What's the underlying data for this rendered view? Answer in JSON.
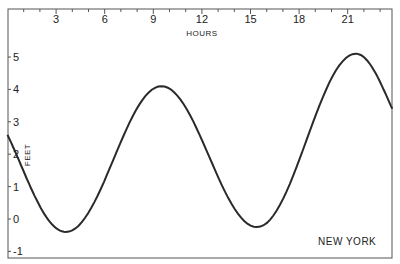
{
  "chart_data": {
    "type": "line",
    "title": "",
    "xlabel": "HOURS",
    "ylabel": "FEET",
    "x_ticks": [
      3,
      6,
      9,
      12,
      15,
      18,
      21
    ],
    "y_ticks": [
      -1,
      0,
      1,
      2,
      3,
      4,
      5
    ],
    "xlim": [
      0,
      23.75
    ],
    "ylim": [
      -1.2,
      6.5
    ],
    "grid": false,
    "legend": null,
    "annotations": [
      "NEW YORK"
    ],
    "series": [
      {
        "name": "New York tide height",
        "x": [
          0,
          1,
          2,
          3,
          3.6,
          4.5,
          6,
          7.5,
          9,
          9.5,
          10.5,
          12,
          13.5,
          15,
          15.4,
          16.5,
          18,
          19.5,
          21,
          21.5,
          22.5,
          23.75
        ],
        "values": [
          2.6,
          1.6,
          0.5,
          -0.3,
          -0.4,
          -0.2,
          1.1,
          2.8,
          4.0,
          4.1,
          3.7,
          2.2,
          0.4,
          -0.2,
          -0.25,
          0.2,
          1.8,
          3.8,
          5.0,
          5.1,
          4.8,
          3.4
        ]
      }
    ],
    "extrema": [
      {
        "kind": "start",
        "hour": 0,
        "feet": 2.6
      },
      {
        "kind": "low",
        "hour": 3.6,
        "feet": -0.4
      },
      {
        "kind": "high",
        "hour": 9.5,
        "feet": 4.1
      },
      {
        "kind": "low",
        "hour": 15.4,
        "feet": -0.25
      },
      {
        "kind": "high",
        "hour": 21.5,
        "feet": 5.1
      },
      {
        "kind": "end",
        "hour": 23.75,
        "feet": 3.4
      }
    ]
  },
  "labels": {
    "x_axis": "HOURS",
    "y_axis": "FEET",
    "location": "NEW YORK",
    "x_ticks": [
      "3",
      "6",
      "9",
      "12",
      "15",
      "18",
      "21"
    ],
    "y_ticks": [
      "5",
      "4",
      "3",
      "2",
      "1",
      "0",
      "-1"
    ]
  },
  "colors": {
    "line": "#2a2a2a",
    "axis": "#555555",
    "background": "#ffffff"
  }
}
